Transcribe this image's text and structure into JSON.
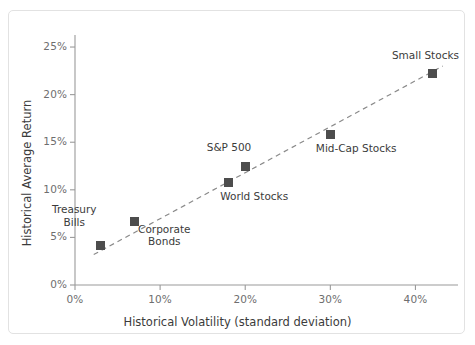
{
  "figure": {
    "border_color": "#e2e2e2",
    "background_color": "#ffffff"
  },
  "chart_data": {
    "type": "scatter",
    "title": "",
    "xlabel": "Historical Volatility (standard deviation)",
    "ylabel": "Historical Average Return",
    "xlim": [
      0,
      45
    ],
    "ylim": [
      0,
      27
    ],
    "grid": false,
    "legend": "none",
    "marker_color": "#4d4d4d",
    "trendline_color": "#8a8a8a",
    "trendline_style": "dashed",
    "axis_color": "#9a9a9a",
    "xticks": [
      0,
      10,
      20,
      30,
      40
    ],
    "xtick_labels": [
      "0%",
      "10%",
      "20%",
      "30%",
      "40%"
    ],
    "yticks": [
      0,
      5,
      10,
      15,
      20,
      25
    ],
    "ytick_labels": [
      "0%",
      "5%",
      "10%",
      "15%",
      "20%",
      "25%"
    ],
    "points": [
      {
        "label": "Treasury\nBills",
        "x": 3,
        "y": 4.1,
        "label_dx": -26,
        "label_dy": -30
      },
      {
        "label": "Corporate\nBonds",
        "x": 7,
        "y": 6.7,
        "label_dx": 30,
        "label_dy": 14
      },
      {
        "label": "World Stocks",
        "x": 18,
        "y": 10.8,
        "label_dx": 26,
        "label_dy": 14
      },
      {
        "label": "S&P 500",
        "x": 20,
        "y": 12.5,
        "label_dx": -16,
        "label_dy": -19
      },
      {
        "label": "Mid-Cap Stocks",
        "x": 30,
        "y": 15.8,
        "label_dx": 26,
        "label_dy": 14
      },
      {
        "label": "Small Stocks",
        "x": 42,
        "y": 22.2,
        "label_dx": -7,
        "label_dy": -18
      }
    ],
    "trendline": {
      "x0": 2.2,
      "y0": 3.2,
      "x1": 43.2,
      "y1": 23.0
    }
  }
}
